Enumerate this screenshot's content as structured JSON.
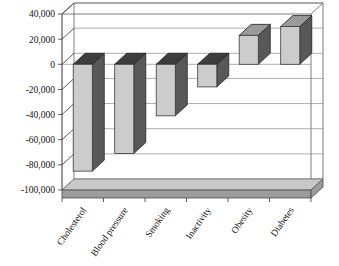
{
  "chart_data": {
    "type": "bar",
    "title": "",
    "subtitle": "",
    "xlabel": "",
    "ylabel": "",
    "categories": [
      "Cholesterol",
      "Blood pressure",
      "Smoking",
      "Inactivity",
      "Obesity",
      "Diabetes"
    ],
    "values": [
      -85000,
      -71000,
      -41000,
      -18000,
      23000,
      30000
    ],
    "ylim": [
      -100000,
      40000
    ],
    "ytick_values": [
      40000,
      20000,
      0,
      -20000,
      -40000,
      -60000,
      -80000,
      -100000
    ],
    "ytick_labels": [
      "40,000",
      "20,000",
      "0",
      "-20,000",
      "-40,000",
      "-60,000",
      "-80,000",
      "-100,000"
    ],
    "grid": true,
    "legend": false,
    "legend_position": "none",
    "style": "3d-column",
    "colors": {
      "bar_front": "#cccccc",
      "bar_side": "#585858",
      "bar_top_negative": "#3d3d3d",
      "bar_top_positive": "#9a9a9a",
      "grid": "#8a8a8a",
      "axis": "#333333",
      "floor": "#9c9c9c",
      "background": "#ffffff",
      "text": "#111111"
    }
  },
  "axis": {
    "y_label_rotation": "0",
    "x_label_rotation": "-55"
  }
}
